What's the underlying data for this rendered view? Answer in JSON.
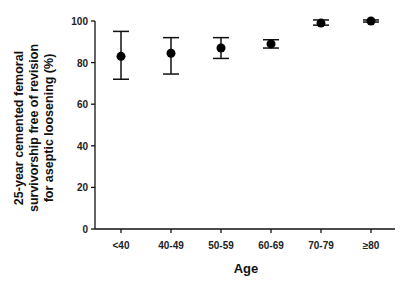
{
  "chart_data": {
    "type": "scatter",
    "title": "",
    "xlabel": "Age",
    "ylabel_lines": [
      "25-year cemented femoral",
      "survivorship free of revision",
      "for aseptic loosening (%)"
    ],
    "ylabel": "25-year cemented femoral survivorship free of revision for aseptic loosening (%)",
    "categories": [
      "<40",
      "40-49",
      "50-59",
      "60-69",
      "70-79",
      "≥80"
    ],
    "values": [
      83,
      84.5,
      87,
      89,
      99,
      100
    ],
    "error_low": [
      72,
      74.5,
      82,
      87,
      98,
      99.5
    ],
    "error_high": [
      95,
      92,
      92,
      91,
      100.5,
      100.5
    ],
    "ylim": [
      0,
      100
    ],
    "yticks": [
      0,
      20,
      40,
      60,
      80,
      100
    ],
    "grid": false,
    "legend": null
  }
}
